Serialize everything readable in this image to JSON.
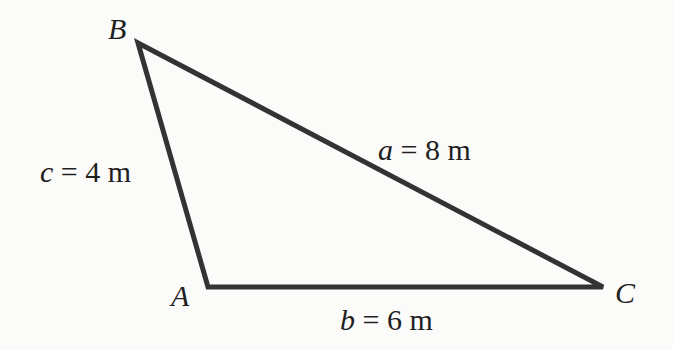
{
  "diagram": {
    "type": "triangle",
    "stroke_color": "#333333",
    "stroke_width": 5,
    "vertices": [
      {
        "name": "B",
        "x": 138,
        "y": 43
      },
      {
        "name": "A",
        "x": 208,
        "y": 287
      },
      {
        "name": "C",
        "x": 603,
        "y": 287
      }
    ],
    "vertex_labels": {
      "A": "A",
      "B": "B",
      "C": "C"
    },
    "sides": {
      "a": {
        "var": "a",
        "eq": " = ",
        "value": "8 m"
      },
      "b": {
        "var": "b",
        "eq": " = ",
        "value": "6 m"
      },
      "c": {
        "var": "c",
        "eq": " = ",
        "value": "4 m"
      }
    }
  }
}
